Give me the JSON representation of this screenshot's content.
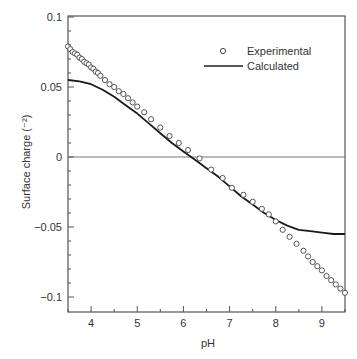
{
  "chart_data": {
    "type": "scatter",
    "title": "",
    "xlabel": "pH",
    "ylabel": "Surface charge (⁻²)",
    "xlim": [
      3.5,
      9.5
    ],
    "ylim": [
      -0.11,
      0.1
    ],
    "xticks": [
      4,
      5,
      6,
      7,
      8,
      9
    ],
    "xtick_labels": [
      "4",
      "5",
      "6",
      "7",
      "8",
      "9"
    ],
    "yticks": [
      0.1,
      0.05,
      0,
      -0.05,
      -0.1
    ],
    "ytick_labels": [
      "0.1",
      "0.05",
      "0",
      "−0.05",
      "−0.1"
    ],
    "grid": false,
    "zero_line": true,
    "legend": {
      "position": "upper right",
      "entries": [
        {
          "label": "Experimental",
          "marker": "open-circle"
        },
        {
          "label": "Calculated",
          "marker": "line"
        }
      ]
    },
    "series": [
      {
        "name": "Experimental",
        "style": "open-circle",
        "x": [
          3.5,
          3.55,
          3.6,
          3.65,
          3.7,
          3.75,
          3.8,
          3.85,
          3.9,
          3.95,
          4.0,
          4.05,
          4.1,
          4.15,
          4.2,
          4.3,
          4.4,
          4.5,
          4.6,
          4.7,
          4.8,
          4.9,
          5.0,
          5.15,
          5.3,
          5.5,
          5.7,
          5.9,
          6.1,
          6.35,
          6.6,
          6.85,
          7.05,
          7.3,
          7.5,
          7.7,
          7.85,
          8.0,
          8.15,
          8.3,
          8.45,
          8.6,
          8.7,
          8.8,
          8.9,
          9.0,
          9.1,
          9.2,
          9.3,
          9.4,
          9.5
        ],
        "y": [
          0.079,
          0.077,
          0.075,
          0.074,
          0.073,
          0.071,
          0.07,
          0.068,
          0.067,
          0.066,
          0.064,
          0.063,
          0.061,
          0.06,
          0.058,
          0.055,
          0.052,
          0.05,
          0.047,
          0.045,
          0.042,
          0.039,
          0.036,
          0.032,
          0.027,
          0.021,
          0.015,
          0.01,
          0.005,
          -0.001,
          -0.009,
          -0.015,
          -0.022,
          -0.027,
          -0.032,
          -0.037,
          -0.041,
          -0.046,
          -0.052,
          -0.057,
          -0.062,
          -0.067,
          -0.071,
          -0.075,
          -0.078,
          -0.081,
          -0.085,
          -0.088,
          -0.091,
          -0.094,
          -0.097
        ]
      },
      {
        "name": "Calculated",
        "style": "line",
        "x": [
          3.5,
          3.75,
          4.0,
          4.25,
          4.5,
          4.75,
          5.0,
          5.25,
          5.5,
          5.75,
          6.0,
          6.25,
          6.5,
          6.75,
          7.0,
          7.25,
          7.5,
          7.75,
          8.0,
          8.25,
          8.5,
          8.75,
          9.0,
          9.25,
          9.5
        ],
        "y": [
          0.055,
          0.054,
          0.052,
          0.048,
          0.043,
          0.037,
          0.031,
          0.024,
          0.017,
          0.01,
          0.004,
          -0.002,
          -0.008,
          -0.014,
          -0.021,
          -0.028,
          -0.034,
          -0.04,
          -0.045,
          -0.049,
          -0.052,
          -0.053,
          -0.054,
          -0.055,
          -0.055
        ]
      }
    ]
  }
}
